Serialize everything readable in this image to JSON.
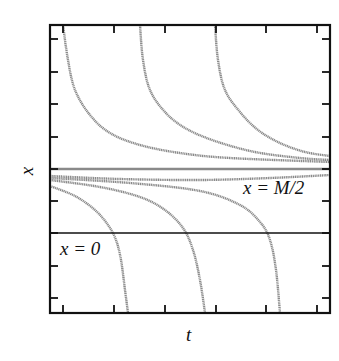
{
  "chart_data": {
    "type": "line",
    "title": "",
    "xlabel": "t",
    "ylabel": "x",
    "grid": false,
    "legend": null,
    "frame": {
      "left": 50,
      "top": 25,
      "right": 330,
      "bottom": 313
    },
    "x_ticks_px": [
      63,
      114,
      165,
      216,
      266,
      317
    ],
    "y_ticks_px": [
      39,
      72,
      104,
      137,
      169,
      201,
      233,
      266,
      298
    ],
    "tick_labels": {
      "x": [],
      "y": []
    },
    "reference_lines": [
      {
        "name": "x = M/2",
        "label": "x = M/2",
        "y_px": 169,
        "style": "gray-dotted"
      },
      {
        "name": "x = 0",
        "label": "x = 0",
        "y_px": 233,
        "style": "solid-black"
      }
    ],
    "series": [
      {
        "name": "upper-curve-1",
        "description": "starts above, decays toward M/2",
        "points_px": [
          [
            63,
            25
          ],
          [
            68,
            60
          ],
          [
            75,
            90
          ],
          [
            90,
            115
          ],
          [
            110,
            133
          ],
          [
            140,
            145
          ],
          [
            180,
            153
          ],
          [
            230,
            158
          ],
          [
            330,
            162
          ]
        ]
      },
      {
        "name": "upper-curve-2",
        "description": "starts above, decays toward M/2",
        "points_px": [
          [
            140,
            25
          ],
          [
            143,
            60
          ],
          [
            150,
            90
          ],
          [
            165,
            112
          ],
          [
            185,
            128
          ],
          [
            215,
            141
          ],
          [
            255,
            152
          ],
          [
            300,
            158
          ],
          [
            330,
            160
          ]
        ]
      },
      {
        "name": "upper-curve-3",
        "description": "starts above, decays toward M/2",
        "points_px": [
          [
            215,
            25
          ],
          [
            218,
            60
          ],
          [
            225,
            90
          ],
          [
            240,
            112
          ],
          [
            258,
            130
          ],
          [
            280,
            143
          ],
          [
            305,
            152
          ],
          [
            330,
            156
          ]
        ]
      },
      {
        "name": "near-asymptote-curve",
        "description": "just below M/2, nearly flat",
        "points_px": [
          [
            50,
            176
          ],
          [
            120,
            179
          ],
          [
            200,
            180
          ],
          [
            270,
            178
          ],
          [
            330,
            175
          ]
        ]
      },
      {
        "name": "lower-curve-1",
        "description": "falls from below M/2 to bottom",
        "points_px": [
          [
            50,
            186
          ],
          [
            75,
            196
          ],
          [
            95,
            210
          ],
          [
            108,
            225
          ],
          [
            116,
            240
          ],
          [
            121,
            260
          ],
          [
            125,
            290
          ],
          [
            128,
            313
          ]
        ]
      },
      {
        "name": "lower-curve-2",
        "description": "falls from below M/2 to bottom",
        "points_px": [
          [
            50,
            180
          ],
          [
            100,
            187
          ],
          [
            140,
            197
          ],
          [
            165,
            210
          ],
          [
            183,
            228
          ],
          [
            193,
            250
          ],
          [
            200,
            280
          ],
          [
            205,
            313
          ]
        ]
      },
      {
        "name": "lower-curve-3",
        "description": "falls from below M/2 to bottom",
        "points_px": [
          [
            50,
            178
          ],
          [
            130,
            183
          ],
          [
            200,
            191
          ],
          [
            240,
            205
          ],
          [
            260,
            222
          ],
          [
            270,
            240
          ],
          [
            276,
            270
          ],
          [
            280,
            313
          ]
        ]
      }
    ],
    "annotations": [
      "x = M/2",
      "x = 0"
    ],
    "colors": {
      "curve": "#8a8a8a",
      "frame": "#111111",
      "zero_line": "#111111"
    }
  },
  "labels": {
    "xlabel": "t",
    "ylabel": "x",
    "annotation_m2": "x = M/2",
    "annotation_zero": "x = 0"
  }
}
